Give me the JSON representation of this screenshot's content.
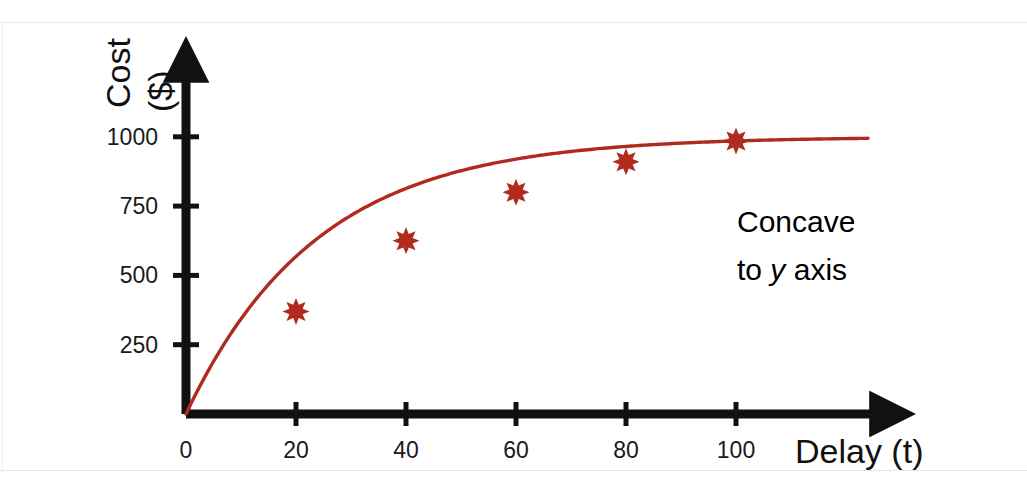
{
  "figure": {
    "background_color": "#ffffff",
    "axis_color": "#111111",
    "series_color": "#b02b1e",
    "annotation_color": "#b8372a",
    "width": 1027,
    "height": 487
  },
  "annotation": {
    "line1": "Concave",
    "line2_prefix": "to ",
    "line2_italic": "y",
    "line2_suffix": " axis"
  },
  "chart_data": {
    "type": "line",
    "title": "",
    "xlabel": "Delay (t)",
    "ylabel": "Cost ($)",
    "ylabel_line1": "Cost",
    "ylabel_line2": "($)",
    "x": [
      0,
      20,
      40,
      60,
      80,
      100
    ],
    "values": [
      0,
      370,
      625,
      800,
      910,
      985
    ],
    "series": [
      {
        "name": "Cost",
        "color": "#b02b1e",
        "marker": "star",
        "points": [
          {
            "x": 20,
            "y": 370
          },
          {
            "x": 40,
            "y": 625
          },
          {
            "x": 60,
            "y": 800
          },
          {
            "x": 80,
            "y": 910
          },
          {
            "x": 100,
            "y": 985
          }
        ]
      }
    ],
    "curve_asymptote": 1000,
    "curve_extends_to_x": 124,
    "xticks": [
      0,
      20,
      40,
      60,
      80,
      100
    ],
    "xtick_labels": [
      "0",
      "20",
      "40",
      "60",
      "80",
      "100"
    ],
    "yticks": [
      250,
      500,
      750,
      1000
    ],
    "ytick_labels": [
      "250",
      "500",
      "750",
      "1000"
    ],
    "xlim": [
      0,
      124
    ],
    "ylim": [
      0,
      1120
    ],
    "grid": false,
    "legend": false,
    "annotations": [
      "Concave to y axis"
    ]
  }
}
